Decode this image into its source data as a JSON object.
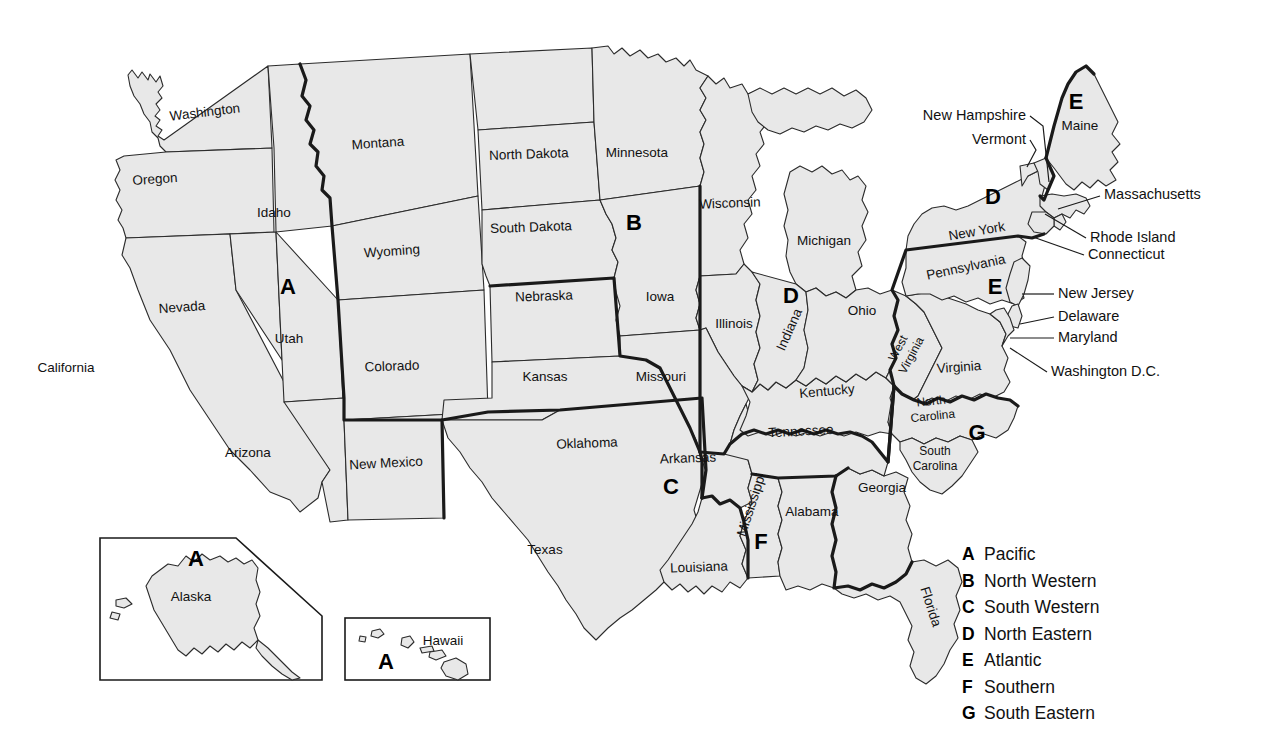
{
  "map": {
    "title": "United States Regions Map",
    "background_color": "#ffffff",
    "state_fill": "#e8e8e8",
    "state_stroke": "#2b2b2b",
    "region_border_color": "#1a1a1a"
  },
  "states": [
    {
      "name": "Washington",
      "x": 205,
      "y": 113,
      "rotate": -7
    },
    {
      "name": "Oregon",
      "x": 155,
      "y": 180,
      "rotate": -4
    },
    {
      "name": "Montana",
      "x": 378,
      "y": 144,
      "rotate": -4
    },
    {
      "name": "Idaho",
      "x": 274,
      "y": 213,
      "rotate": 0
    },
    {
      "name": "Wyoming",
      "x": 392,
      "y": 252,
      "rotate": -4
    },
    {
      "name": "North Dakota",
      "x": 529,
      "y": 155,
      "rotate": -2
    },
    {
      "name": "South Dakota",
      "x": 531,
      "y": 228,
      "rotate": -2
    },
    {
      "name": "Minnesota",
      "x": 637,
      "y": 153,
      "rotate": 0
    },
    {
      "name": "Wisconsin",
      "x": 730,
      "y": 204,
      "rotate": -2
    },
    {
      "name": "Michigan",
      "x": 824,
      "y": 241,
      "rotate": 0
    },
    {
      "name": "Nebraska",
      "x": 544,
      "y": 297,
      "rotate": -2
    },
    {
      "name": "Iowa",
      "x": 660,
      "y": 297,
      "rotate": 0
    },
    {
      "name": "Illinois",
      "x": 734,
      "y": 324,
      "rotate": 0
    },
    {
      "name": "Indiana",
      "x": 790,
      "y": 330,
      "rotate": -66
    },
    {
      "name": "Ohio",
      "x": 862,
      "y": 311,
      "rotate": 0
    },
    {
      "name": "Nevada",
      "x": 182,
      "y": 308,
      "rotate": -4
    },
    {
      "name": "Utah",
      "x": 289,
      "y": 339,
      "rotate": 0
    },
    {
      "name": "Colorado",
      "x": 392,
      "y": 367,
      "rotate": -2
    },
    {
      "name": "Kansas",
      "x": 545,
      "y": 377,
      "rotate": 0
    },
    {
      "name": "Missouri",
      "x": 661,
      "y": 377,
      "rotate": 0
    },
    {
      "name": "California",
      "x": 66,
      "y": 368,
      "rotate": 0
    },
    {
      "name": "Arizona",
      "x": 248,
      "y": 453,
      "rotate": 0
    },
    {
      "name": "New Mexico",
      "x": 386,
      "y": 464,
      "rotate": -3
    },
    {
      "name": "Oklahoma",
      "x": 587,
      "y": 444,
      "rotate": -2
    },
    {
      "name": "Arkansas",
      "x": 688,
      "y": 459,
      "rotate": -2
    },
    {
      "name": "Texas",
      "x": 545,
      "y": 550,
      "rotate": 0
    },
    {
      "name": "Louisiana",
      "x": 699,
      "y": 568,
      "rotate": -2
    },
    {
      "name": "Mississippi",
      "x": 752,
      "y": 505,
      "rotate": -72
    },
    {
      "name": "Alabama",
      "x": 812,
      "y": 512,
      "rotate": 0
    },
    {
      "name": "Georgia",
      "x": 882,
      "y": 488,
      "rotate": 0
    },
    {
      "name": "Florida",
      "x": 930,
      "y": 607,
      "rotate": 72
    },
    {
      "name": "Tennessee",
      "x": 801,
      "y": 432,
      "rotate": -3
    },
    {
      "name": "Kentucky",
      "x": 827,
      "y": 392,
      "rotate": -5
    },
    {
      "name": "West Virginia",
      "x": 905,
      "y": 352,
      "rotate": -62
    },
    {
      "name": "Virginia",
      "x": 959,
      "y": 368,
      "rotate": -4
    },
    {
      "name": "North Carolina",
      "x": 932,
      "y": 409,
      "rotate": -6
    },
    {
      "name": "South Carolina",
      "x": 935,
      "y": 459,
      "rotate": 0
    },
    {
      "name": "Pennsylvania",
      "x": 966,
      "y": 268,
      "rotate": -12
    },
    {
      "name": "New York",
      "x": 977,
      "y": 232,
      "rotate": -10
    },
    {
      "name": "Maine",
      "x": 1080,
      "y": 126,
      "rotate": 0
    }
  ],
  "state_label_lines": {
    "North Carolina": [
      "North",
      "Carolina"
    ],
    "South Carolina": [
      "South",
      "Carolina"
    ],
    "West Virginia": [
      "West",
      "Virginia"
    ]
  },
  "region_letters": [
    {
      "letter": "A",
      "x": 288,
      "y": 288
    },
    {
      "letter": "B",
      "x": 634,
      "y": 224
    },
    {
      "letter": "C",
      "x": 671,
      "y": 488
    },
    {
      "letter": "D",
      "x": 791,
      "y": 297
    },
    {
      "letter": "D",
      "x": 993,
      "y": 198
    },
    {
      "letter": "E",
      "x": 995,
      "y": 288
    },
    {
      "letter": "E",
      "x": 1076,
      "y": 103
    },
    {
      "letter": "F",
      "x": 761,
      "y": 543
    },
    {
      "letter": "G",
      "x": 977,
      "y": 434
    }
  ],
  "callouts": [
    {
      "name": "New Hampshire",
      "text_x": 1026,
      "text_y": 116,
      "anchor": "end",
      "line": [
        [
          1030,
          116
        ],
        [
          1043,
          126
        ],
        [
          1049,
          182
        ]
      ]
    },
    {
      "name": "Vermont",
      "text_x": 1026,
      "text_y": 140,
      "anchor": "end",
      "line": [
        [
          1030,
          140
        ],
        [
          1036,
          150
        ],
        [
          1027,
          167
        ]
      ]
    },
    {
      "name": "Massachusetts",
      "text_x": 1104,
      "text_y": 195,
      "anchor": "start",
      "line": [
        [
          1100,
          196
        ],
        [
          1058,
          209
        ]
      ]
    },
    {
      "name": "Rhode Island",
      "text_x": 1090,
      "text_y": 238,
      "anchor": "start",
      "line": [
        [
          1086,
          238
        ],
        [
          1045,
          214
        ]
      ]
    },
    {
      "name": "Connecticut",
      "text_x": 1088,
      "text_y": 255,
      "anchor": "start",
      "line": [
        [
          1084,
          255
        ],
        [
          1033,
          237
        ]
      ]
    },
    {
      "name": "New Jersey",
      "text_x": 1058,
      "text_y": 294,
      "anchor": "start",
      "line": [
        [
          1054,
          294
        ],
        [
          1022,
          294
        ]
      ]
    },
    {
      "name": "Delaware",
      "text_x": 1058,
      "text_y": 317,
      "anchor": "start",
      "line": [
        [
          1054,
          317
        ],
        [
          1020,
          324
        ]
      ]
    },
    {
      "name": "Maryland",
      "text_x": 1058,
      "text_y": 338,
      "anchor": "start",
      "line": [
        [
          1054,
          338
        ],
        [
          1010,
          338
        ]
      ]
    },
    {
      "name": "Washington D.C.",
      "text_x": 1051,
      "text_y": 372,
      "anchor": "start",
      "line": [
        [
          1047,
          372
        ],
        [
          1010,
          348
        ]
      ]
    }
  ],
  "insets": [
    {
      "name": "Alaska",
      "label": "Alaska",
      "label_x": 191,
      "label_y": 597,
      "letter": "A",
      "letter_x": 196,
      "letter_y": 560
    },
    {
      "name": "Hawaii",
      "label": "Hawaii",
      "label_x": 443,
      "label_y": 641,
      "letter": "A",
      "letter_x": 386,
      "letter_y": 663
    }
  ],
  "legend": {
    "items": [
      {
        "key": "A",
        "name": "Pacific"
      },
      {
        "key": "B",
        "name": "North Western"
      },
      {
        "key": "C",
        "name": "South Western"
      },
      {
        "key": "D",
        "name": "North Eastern"
      },
      {
        "key": "E",
        "name": "Atlantic"
      },
      {
        "key": "F",
        "name": "Southern"
      },
      {
        "key": "G",
        "name": "South Eastern"
      }
    ]
  },
  "chart_data": {
    "type": "map",
    "regions": [
      {
        "key": "A",
        "name": "Pacific",
        "states": [
          "Washington",
          "Oregon",
          "California",
          "Nevada",
          "Idaho",
          "Utah",
          "Arizona",
          "Alaska",
          "Hawaii"
        ]
      },
      {
        "key": "B",
        "name": "North Western",
        "states": [
          "Montana",
          "Wyoming",
          "Colorado",
          "North Dakota",
          "South Dakota",
          "Nebraska",
          "Kansas",
          "Minnesota",
          "Iowa",
          "Missouri",
          "Wisconsin"
        ]
      },
      {
        "key": "C",
        "name": "South Western",
        "states": [
          "New Mexico",
          "Texas",
          "Oklahoma",
          "Arkansas",
          "Louisiana"
        ]
      },
      {
        "key": "D",
        "name": "North Eastern",
        "states": [
          "Illinois",
          "Indiana",
          "Michigan",
          "Ohio",
          "New York",
          "Vermont",
          "New Hampshire"
        ]
      },
      {
        "key": "E",
        "name": "Atlantic",
        "states": [
          "Maine",
          "Massachusetts",
          "Rhode Island",
          "Connecticut",
          "Pennsylvania",
          "New Jersey",
          "Delaware",
          "Maryland",
          "Washington D.C.",
          "West Virginia",
          "Virginia"
        ]
      },
      {
        "key": "F",
        "name": "Southern",
        "states": [
          "Kentucky",
          "Tennessee",
          "Mississippi",
          "Alabama"
        ]
      },
      {
        "key": "G",
        "name": "South Eastern",
        "states": [
          "North Carolina",
          "South Carolina",
          "Georgia",
          "Florida"
        ]
      }
    ]
  }
}
